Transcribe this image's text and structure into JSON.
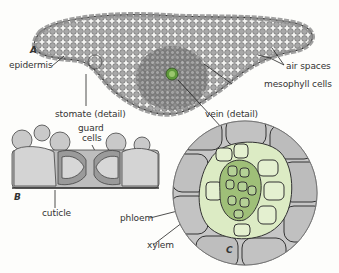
{
  "diagram": {
    "type": "leaf cross-section",
    "panels": [
      {
        "id": "A",
        "label": "A",
        "content": "leaf cross-section overview"
      },
      {
        "id": "B",
        "label": "B",
        "content": "stomate detail"
      },
      {
        "id": "C",
        "label": "C",
        "content": "vein detail"
      }
    ],
    "labels": {
      "epidermis": "epidermis",
      "air_spaces": "air spaces",
      "mesophyll_cells": "mesophyll cells",
      "stomate_detail": "stomate (detail)",
      "vein_detail": "vein (detail)",
      "guard_cells_line1": "guard",
      "guard_cells_line2": "cells",
      "cuticle": "cuticle",
      "phloem": "phloem",
      "xylem": "xylem"
    },
    "colors": {
      "cell_gray": "#9a9a9a",
      "cell_light": "#cfcfcf",
      "phloem_green": "#dcebc4",
      "xylem_green": "#9fbf78",
      "vein_core": "#5f9a3a",
      "outline": "#3a3a3a"
    }
  }
}
